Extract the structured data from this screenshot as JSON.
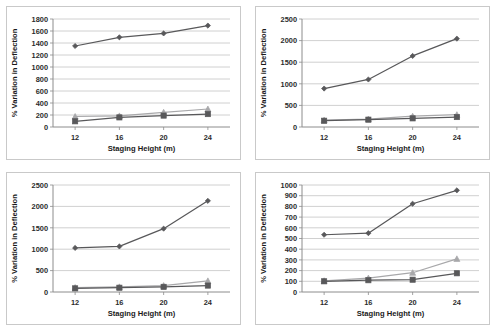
{
  "figure": {
    "panel_count": 4,
    "background": "#ffffff",
    "border_color": "#c9c9c9"
  },
  "colors": {
    "dark_gray": "#58585a",
    "mid_gray": "#7a7a7c",
    "light_gray": "#a8a8aa",
    "grid": "#c4c4c4",
    "axis": "#8c8c8c",
    "text": "#1a1a1a"
  },
  "chart_data": [
    {
      "id": "panel-a",
      "type": "line",
      "title": "",
      "xlabel": "Staging Height (m)",
      "ylabel": "% Variation  in Deflection",
      "categories": [
        12,
        16,
        20,
        24
      ],
      "xticks": [
        "12",
        "16",
        "20",
        "24"
      ],
      "yticks": [
        "0",
        "200",
        "400",
        "600",
        "800",
        "1000",
        "1200",
        "1400",
        "1600",
        "1800"
      ],
      "ylim": [
        0,
        1800
      ],
      "ystep": 200,
      "grid": true,
      "legend": "none",
      "series": [
        {
          "name": "series-1",
          "marker": "diamond",
          "color": "#58585a",
          "values": [
            1350,
            1495,
            1560,
            1690
          ]
        },
        {
          "name": "series-2",
          "marker": "triangle",
          "color": "#a8a8aa",
          "values": [
            175,
            185,
            245,
            300
          ]
        },
        {
          "name": "series-3",
          "marker": "square",
          "color": "#58585a",
          "values": [
            95,
            160,
            190,
            215
          ]
        }
      ]
    },
    {
      "id": "panel-b",
      "type": "line",
      "title": "",
      "xlabel": "Staging Height (m)",
      "ylabel": "% Variation  in Deflection",
      "categories": [
        12,
        16,
        20,
        24
      ],
      "xticks": [
        "12",
        "16",
        "20",
        "24"
      ],
      "yticks": [
        "0",
        "500",
        "1000",
        "1500",
        "2000",
        "2500"
      ],
      "ylim": [
        0,
        2500
      ],
      "ystep": 500,
      "grid": true,
      "legend": "none",
      "series": [
        {
          "name": "series-1",
          "marker": "diamond",
          "color": "#58585a",
          "values": [
            890,
            1100,
            1645,
            2045
          ]
        },
        {
          "name": "series-2",
          "marker": "triangle",
          "color": "#a8a8aa",
          "values": [
            160,
            185,
            250,
            285
          ]
        },
        {
          "name": "series-3",
          "marker": "square",
          "color": "#58585a",
          "values": [
            145,
            170,
            200,
            230
          ]
        }
      ]
    },
    {
      "id": "panel-c",
      "type": "line",
      "title": "",
      "xlabel": "Staging Height (m)",
      "ylabel": "% Variation  in Deflection",
      "categories": [
        12,
        16,
        20,
        24
      ],
      "xticks": [
        "12",
        "16",
        "20",
        "24"
      ],
      "yticks": [
        "0",
        "500",
        "1000",
        "1500",
        "2000",
        "2500"
      ],
      "ylim": [
        0,
        2500
      ],
      "ystep": 500,
      "grid": true,
      "legend": "none",
      "series": [
        {
          "name": "series-1",
          "marker": "diamond",
          "color": "#58585a",
          "values": [
            1030,
            1065,
            1480,
            2130
          ]
        },
        {
          "name": "series-2",
          "marker": "triangle",
          "color": "#a8a8aa",
          "values": [
            105,
            120,
            150,
            260
          ]
        },
        {
          "name": "series-3",
          "marker": "square",
          "color": "#58585a",
          "values": [
            85,
            100,
            120,
            150
          ]
        }
      ]
    },
    {
      "id": "panel-d",
      "type": "line",
      "title": "",
      "xlabel": "Staging Height (m)",
      "ylabel": "% Variation  in Deflection",
      "categories": [
        12,
        16,
        20,
        24
      ],
      "xticks": [
        "12",
        "16",
        "20",
        "24"
      ],
      "yticks": [
        "0",
        "100",
        "200",
        "300",
        "400",
        "500",
        "600",
        "700",
        "800",
        "900",
        "1000"
      ],
      "ylim": [
        0,
        1000
      ],
      "ystep": 100,
      "grid": true,
      "legend": "none",
      "series": [
        {
          "name": "series-1",
          "marker": "diamond",
          "color": "#58585a",
          "values": [
            535,
            550,
            825,
            950
          ]
        },
        {
          "name": "series-2",
          "marker": "triangle",
          "color": "#a8a8aa",
          "values": [
            105,
            130,
            180,
            310
          ]
        },
        {
          "name": "series-3",
          "marker": "square",
          "color": "#58585a",
          "values": [
            100,
            110,
            115,
            175
          ]
        }
      ]
    }
  ]
}
